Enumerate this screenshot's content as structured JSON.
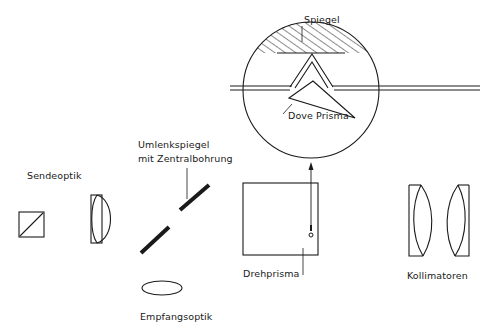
{
  "diagram": {
    "labels": {
      "spiegel": "Spiegel",
      "dove_prisma": "Dove Prisma",
      "sendeoptik": "Sendeoptik",
      "umlenkspiegel_line1": "Umlenkspiegel",
      "umlenkspiegel_line2": "mit Zentralbohrung",
      "empfangsoptik": "Empfangsoptik",
      "drehprisma": "Drehprisma",
      "kollimatoren": "Kollimatoren"
    },
    "colors": {
      "stroke": "#1a1a1a",
      "background": "#ffffff"
    },
    "components": [
      {
        "id": "sendeoptik-beamsplitter",
        "shape": "square-with-diagonal"
      },
      {
        "id": "sendeoptik-lens",
        "shape": "plano-convex-lens"
      },
      {
        "id": "umlenkspiegel",
        "shape": "split-diagonal-mirror"
      },
      {
        "id": "empfangsoptik",
        "shape": "ellipse-lens"
      },
      {
        "id": "drehprisma",
        "shape": "square"
      },
      {
        "id": "detail-view",
        "shape": "circle-with-dove-prism-and-mirror"
      },
      {
        "id": "kollimatoren",
        "shape": "two-biconvex-lenses"
      }
    ]
  }
}
